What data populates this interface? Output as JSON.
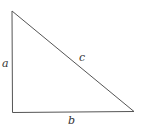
{
  "diagram": {
    "type": "right-triangle",
    "stroke_color": "#555555",
    "label_color": "#333333",
    "vertices": {
      "top": [
        12,
        11
      ],
      "right_angle": [
        12,
        112
      ],
      "bottom_right": [
        134,
        111
      ]
    },
    "labels": {
      "a": "a",
      "b": "b",
      "c": "c"
    }
  }
}
